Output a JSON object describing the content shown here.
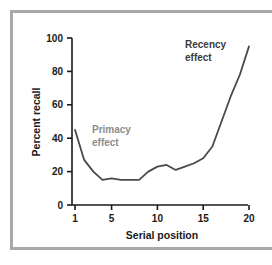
{
  "figure": {
    "frame_color": "#a8a8a8",
    "background_color": "#ffffff"
  },
  "chart_data": {
    "type": "line",
    "title": "",
    "xlabel": "Serial position",
    "ylabel": "Percent recall",
    "xlim": [
      1,
      20
    ],
    "ylim": [
      0,
      100
    ],
    "xticks": [
      "1",
      "5",
      "10",
      "15",
      "20"
    ],
    "xtick_values": [
      1,
      5,
      10,
      15,
      20
    ],
    "yticks": [
      "0",
      "20",
      "40",
      "60",
      "80",
      "100"
    ],
    "ytick_values": [
      0,
      20,
      40,
      60,
      80,
      100
    ],
    "grid": false,
    "legend": "none",
    "line_color": "#4a4a4a",
    "x": [
      1,
      2,
      3,
      4,
      5,
      6,
      7,
      8,
      9,
      10,
      11,
      12,
      13,
      14,
      15,
      16,
      17,
      18,
      19,
      20
    ],
    "values": [
      45,
      27,
      20,
      15,
      16,
      15,
      15,
      15,
      20,
      23,
      24,
      21,
      23,
      25,
      28,
      35,
      50,
      65,
      78,
      95
    ],
    "series": [
      {
        "name": "Percent recall",
        "values": [
          45,
          27,
          20,
          15,
          16,
          15,
          15,
          15,
          20,
          23,
          24,
          21,
          23,
          25,
          28,
          35,
          50,
          65,
          78,
          95
        ]
      }
    ],
    "annotations": [
      {
        "id": "primacy",
        "line1": "Primacy",
        "line2": "effect",
        "color": "#8c8c8c",
        "x": 3.2,
        "y": 46
      },
      {
        "id": "recency",
        "line1": "Recency",
        "line2": "effect",
        "color": "#3a3a3a",
        "x": 14.2,
        "y": 88
      }
    ]
  }
}
